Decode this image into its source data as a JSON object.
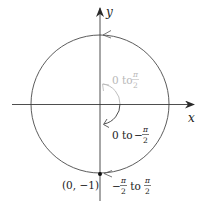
{
  "diagram": {
    "type": "unit-circle-parametrization",
    "axes": {
      "x_label": "x",
      "y_label": "y"
    },
    "colors": {
      "line": "#3a3a3a",
      "gray_label": "#b8b8b8",
      "background": "#ffffff"
    },
    "labels": {
      "arc_upper": {
        "prefix": "0 to ",
        "frac_num": "π",
        "frac_den": "2",
        "sign": ""
      },
      "arc_lower": {
        "prefix": "0 to ",
        "frac_num": "π",
        "frac_den": "2",
        "sign": "−"
      },
      "range": {
        "left_sign": "−",
        "left_num": "π",
        "left_den": "2",
        "mid": " to ",
        "right_num": "π",
        "right_den": "2"
      },
      "point": "(0, −1)"
    }
  }
}
